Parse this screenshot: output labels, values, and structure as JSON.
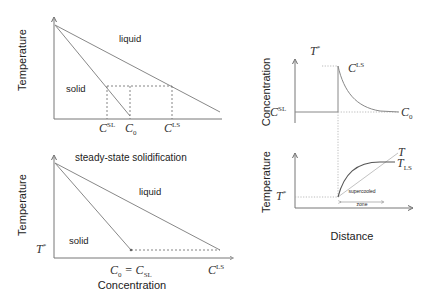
{
  "panels": {
    "phase_diagram_top": {
      "ylabel": "Temperature",
      "region_liquid": "liquid",
      "region_solid": "solid",
      "xlabels": {
        "c_sl": "C",
        "c_sl_sup": "SL",
        "c0": "C",
        "c0_sub": "0",
        "c_ls": "C",
        "c_ls_sup": "LS"
      }
    },
    "phase_diagram_bottom": {
      "title": "steady-state solidification",
      "ylabel": "Temperature",
      "xlabel": "Concentration",
      "region_liquid": "liquid",
      "region_solid": "solid",
      "t_star": "T",
      "t_star_sup": "*",
      "xlabels": {
        "c0_eq": "C",
        "c0_eq_sub": "0",
        "eq_sign": " = C",
        "c_sl_sub": "SL",
        "c_ls": "C",
        "c_ls_sup": "LS"
      }
    },
    "concentration_profile": {
      "ylabel": "Concentration",
      "t_star": "T",
      "t_star_sup": "*",
      "c_ls": "C",
      "c_ls_sup": "LS",
      "c_sl": "C",
      "c_sl_sup": "SL",
      "c0": "C",
      "c0_sub": "0"
    },
    "temperature_profile": {
      "ylabel": "Temperature",
      "xlabel": "Distance",
      "t_label": "T",
      "t_ls": "T",
      "t_ls_sub": "LS",
      "t_star": "T",
      "t_star_sup": "*",
      "zone_line1": "supercooled",
      "zone_line2": "zone"
    }
  }
}
